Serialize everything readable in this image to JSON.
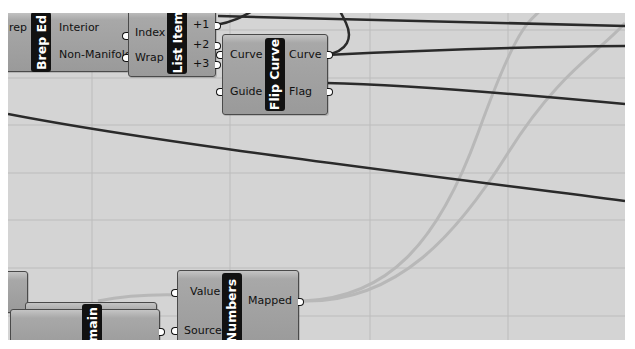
{
  "app": "Grasshopper canvas",
  "canvas": {
    "background": "#d4d4d4",
    "grid_color": "#bcbcbc",
    "wire_color": "#2a2a2a",
    "selected_wire_color": "#b5b5b5"
  },
  "components": {
    "brep_edges": {
      "nickname": "Brep Ed",
      "inputs": [
        {
          "label": "rep"
        }
      ],
      "outputs": [
        {
          "label": "Interior"
        },
        {
          "label": "Non-Manifold"
        }
      ]
    },
    "list_item": {
      "nickname": "List Item",
      "inputs": [
        {
          "label": "Index"
        },
        {
          "label": "Wrap"
        }
      ],
      "outputs": [
        {
          "label": "+1"
        },
        {
          "label": "+2"
        },
        {
          "label": "+3"
        }
      ]
    },
    "flip_curve": {
      "nickname": "Flip Curve",
      "inputs": [
        {
          "label": "Curve"
        },
        {
          "label": "Guide"
        }
      ],
      "outputs": [
        {
          "label": "Curve"
        },
        {
          "label": "Flag"
        }
      ]
    },
    "remap_numbers": {
      "nickname": "Numbers",
      "inputs": [
        {
          "label": "Value"
        },
        {
          "label": "Source"
        }
      ],
      "outputs": [
        {
          "label": "Mapped"
        }
      ]
    },
    "domain": {
      "nickname": "main"
    }
  }
}
